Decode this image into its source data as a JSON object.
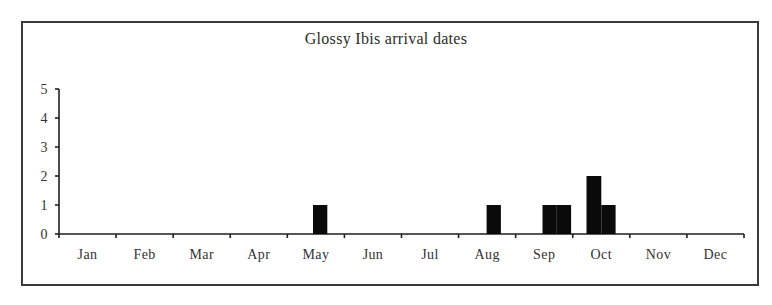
{
  "chart_data": {
    "type": "bar",
    "title": "Glossy Ibis arrival dates",
    "xlabel": "",
    "ylabel": "",
    "ylim": [
      0,
      5
    ],
    "yticks": [
      0,
      1,
      2,
      3,
      4,
      5
    ],
    "grid": false,
    "legend": null,
    "categories": [
      "Jan",
      "Feb",
      "Mar",
      "Apr",
      "May",
      "Jun",
      "Jul",
      "Aug",
      "Sep",
      "Oct",
      "Nov",
      "Dec"
    ],
    "bin_note": "Bars are sub-month (roughly quarter-month) periods; month_index is 0-based, start is fractional position within month",
    "bars": [
      {
        "month": "May",
        "month_index": 4,
        "start": 0.45,
        "width": 0.25,
        "value": 1
      },
      {
        "month": "Aug",
        "month_index": 7,
        "start": 0.49,
        "width": 0.25,
        "value": 1
      },
      {
        "month": "Sep",
        "month_index": 8,
        "start": 0.47,
        "width": 0.25,
        "value": 1
      },
      {
        "month": "Sep",
        "month_index": 8,
        "start": 0.72,
        "width": 0.25,
        "value": 1
      },
      {
        "month": "Oct",
        "month_index": 9,
        "start": 0.24,
        "width": 0.26,
        "value": 2
      },
      {
        "month": "Oct",
        "month_index": 9,
        "start": 0.5,
        "width": 0.25,
        "value": 1
      }
    ],
    "monthly_totals": {
      "Jan": 0,
      "Feb": 0,
      "Mar": 0,
      "Apr": 0,
      "May": 1,
      "Jun": 0,
      "Jul": 0,
      "Aug": 1,
      "Sep": 2,
      "Oct": 3,
      "Nov": 0,
      "Dec": 0
    }
  },
  "colors": {
    "bar": "#0a0a0a",
    "axis": "#1e1e1e",
    "text": "#333333",
    "frame": "#3a3a3a",
    "background": "#ffffff"
  }
}
